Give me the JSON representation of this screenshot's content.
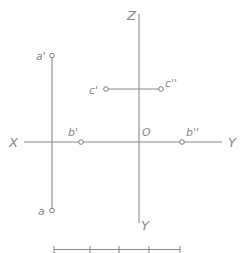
{
  "diagram": {
    "type": "orthographic-projection-axes",
    "colors": {
      "line": "#8a8a8a",
      "label": "#888888",
      "background": "#ffffff"
    },
    "axes": {
      "z_label": "Z",
      "y_bottom_label": "Y",
      "x_label": "X",
      "y_right_label": "Y",
      "origin_label": "O"
    },
    "points": {
      "a_prime": "a'",
      "a": "a",
      "b_prime": "b'",
      "b_double_prime": "b''",
      "c_prime": "c'",
      "c_double_prime": "c''"
    },
    "scale_bar": {
      "divisions": 4
    }
  }
}
